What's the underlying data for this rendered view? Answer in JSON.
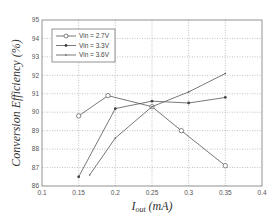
{
  "chart_data": {
    "type": "line",
    "title": "",
    "xlabel": "I_out (mA)",
    "ylabel": "Conversion Efficiency (%)",
    "xlim": [
      0.1,
      0.4
    ],
    "ylim": [
      86,
      95
    ],
    "xticks": [
      0.1,
      0.15,
      0.2,
      0.25,
      0.3,
      0.35,
      0.4
    ],
    "xtick_labels": [
      "0.1",
      "0.15",
      "0.2",
      "0.25",
      "0.3",
      "0.35",
      "0.4"
    ],
    "yticks": [
      86,
      87,
      88,
      89,
      90,
      91,
      92,
      93,
      94,
      95
    ],
    "ytick_labels": [
      "86",
      "87",
      "88",
      "89",
      "90",
      "91",
      "92",
      "93",
      "94",
      "95"
    ],
    "grid": true,
    "legend_position": "upper left",
    "series": [
      {
        "name": "Vin = 2.7V",
        "marker": "circle-open",
        "x": [
          0.15,
          0.19,
          0.25,
          0.29,
          0.35
        ],
        "y": [
          89.8,
          90.9,
          90.3,
          89.0,
          87.1
        ]
      },
      {
        "name": "Vin = 3.3V",
        "marker": "dot-filled",
        "x": [
          0.15,
          0.2,
          0.25,
          0.3,
          0.35
        ],
        "y": [
          86.5,
          90.2,
          90.6,
          90.5,
          90.8
        ]
      },
      {
        "name": "Vin = 3.6V",
        "marker": "point",
        "x": [
          0.165,
          0.2,
          0.25,
          0.3,
          0.35
        ],
        "y": [
          86.6,
          88.6,
          90.3,
          91.1,
          92.1
        ]
      }
    ]
  },
  "labels": {
    "ylabel": "Conversion Efficiency (%)",
    "xlabel_main": "I",
    "xlabel_sub": "out",
    "xlabel_unit": " (mA)"
  },
  "legend": [
    {
      "label": "Vin = 2.7V"
    },
    {
      "label": "Vin = 3.3V"
    },
    {
      "label": "Vin = 3.6V"
    }
  ],
  "colors": {
    "line": "#555555",
    "grid": "#999999",
    "axis": "#777777"
  }
}
